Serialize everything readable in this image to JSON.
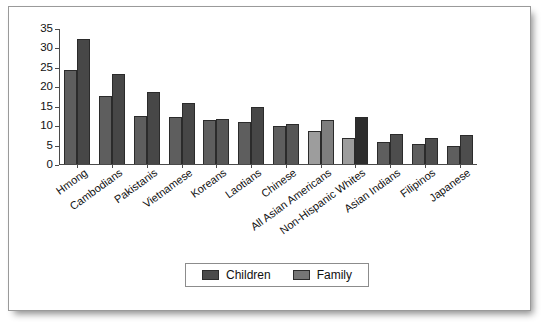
{
  "chart_data": {
    "type": "bar",
    "title": "",
    "subtitle": "",
    "xlabel": "",
    "ylabel": "",
    "ylim": [
      0,
      35
    ],
    "ytick_step": 5,
    "yticks": [
      "35",
      "30",
      "25",
      "20",
      "15",
      "10",
      "5",
      "0"
    ],
    "grid": false,
    "legend_position": "bottom-center",
    "categories": [
      "Hmong",
      "Cambodians",
      "Pakistanis",
      "Vietnamese",
      "Koreans",
      "Laotians",
      "Chinese",
      "All Asian Americans",
      "Non-Hispanic Whites",
      "Asian Indians",
      "Filipinos",
      "Japanese"
    ],
    "series": [
      {
        "name": "Children",
        "color": "#5a5a5a",
        "values": [
          24.5,
          17.7,
          12.5,
          12.3,
          11.4,
          10.8,
          9.8,
          8.6,
          6.7,
          5.6,
          5.2,
          4.7
        ]
      },
      {
        "name": "Family",
        "color": "#4a4a4a",
        "values": [
          32.5,
          23.3,
          18.7,
          15.7,
          11.7,
          14.7,
          10.3,
          11.3,
          12.1,
          7.8,
          6.8,
          7.4
        ]
      }
    ],
    "bar_colors": {
      "Hmong": [
        "#5e5e5e",
        "#474747"
      ],
      "Cambodians": [
        "#5e5e5e",
        "#474747"
      ],
      "Pakistanis": [
        "#5e5e5e",
        "#474747"
      ],
      "Vietnamese": [
        "#5e5e5e",
        "#474747"
      ],
      "Koreans": [
        "#5e5e5e",
        "#565656"
      ],
      "Laotians": [
        "#5e5e5e",
        "#474747"
      ],
      "Chinese": [
        "#5e5e5e",
        "#565656"
      ],
      "All Asian Americans": [
        "#9d9d9d",
        "#7e7e7e"
      ],
      "Non-Hispanic Whites": [
        "#9d9d9d",
        "#2d2d2d"
      ],
      "Asian Indians": [
        "#5e5e5e",
        "#4d4d4d"
      ],
      "Filipinos": [
        "#5e5e5e",
        "#4d4d4d"
      ],
      "Japanese": [
        "#5e5e5e",
        "#4d4d4d"
      ]
    }
  },
  "legend": {
    "items": [
      {
        "label": "Children",
        "color": "#4a4a4a"
      },
      {
        "label": "Family",
        "color": "#757575"
      }
    ]
  }
}
